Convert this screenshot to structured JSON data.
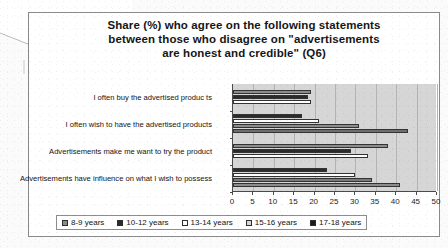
{
  "document": {
    "kind": "scanned-page",
    "fold_corner": true
  },
  "chart_data": {
    "type": "bar",
    "orientation": "horizontal",
    "title": "Share (%) who agree on the following statements between those who disagree on \"advertisements are honest and credible\" (Q6)",
    "title_lines": [
      "Share (%) who agree on the following statements",
      "between those who disagree on \"advertisements",
      "are honest and credible\" (Q6)"
    ],
    "xlabel": "",
    "ylabel": "",
    "xlim": [
      0,
      50
    ],
    "xticks": [
      0,
      5,
      10,
      15,
      20,
      25,
      30,
      35,
      40,
      45,
      50
    ],
    "grid": true,
    "legend_position": "bottom",
    "categories": [
      "I often buy  the advertised produc ts",
      "I often wish to have the advertised products",
      "Advertisements make me want to try the product",
      "Advertisements have influence on what I wish to possess"
    ],
    "series": [
      {
        "name": "8-9 years",
        "color": "#8c8c8c",
        "values": [
          0,
          0,
          0,
          0
        ]
      },
      {
        "name": "10-12 years",
        "color": "#2b2b2b",
        "values": [
          0,
          0,
          35,
          0
        ]
      },
      {
        "name": "13-14 years",
        "color": "#ffffff",
        "values": [
          0,
          0,
          0,
          0
        ]
      },
      {
        "name": "15-16 years",
        "color": "#d0d0d0",
        "values": [
          0,
          0,
          0,
          0
        ]
      },
      {
        "name": "17-18 years",
        "color": "#1a1a1a",
        "values": [
          0,
          0,
          0,
          0
        ]
      }
    ],
    "bars": [
      {
        "category_index": 0,
        "series": "8-9 years",
        "value": 19.0,
        "color": "#8c8c8c"
      },
      {
        "category_index": 0,
        "series": "10-12 years",
        "value": 18.5,
        "color": "#2b2b2b"
      },
      {
        "category_index": 0,
        "series": "13-14 years",
        "value": 19.0,
        "color": "#ffffff"
      },
      {
        "category_index": 1,
        "series": "10-12 years",
        "value": 17.0,
        "color": "#2b2b2b"
      },
      {
        "category_index": 1,
        "series": "13-14 years",
        "value": 21.0,
        "color": "#ffffff"
      },
      {
        "category_index": 1,
        "series": "15-16 years",
        "value": 31.0,
        "color": "#8c8c8c"
      },
      {
        "category_index": 1,
        "series": "17-18 years",
        "value": 43.0,
        "color": "#6e6e6e"
      },
      {
        "category_index": 2,
        "series": "8-9 years",
        "value": 38.0,
        "color": "#8c8c8c"
      },
      {
        "category_index": 2,
        "series": "10-12 years",
        "value": 29.0,
        "color": "#2b2b2b"
      },
      {
        "category_index": 2,
        "series": "13-14 years",
        "value": 33.0,
        "color": "#ffffff"
      },
      {
        "category_index": 3,
        "series": "10-12 years",
        "value": 23.0,
        "color": "#2b2b2b"
      },
      {
        "category_index": 3,
        "series": "13-14 years",
        "value": 30.0,
        "color": "#ffffff"
      },
      {
        "category_index": 3,
        "series": "15-16 years",
        "value": 34.0,
        "color": "#7a7a7a"
      },
      {
        "category_index": 3,
        "series": "17-18 years",
        "value": 41.0,
        "color": "#8c8c8c"
      }
    ],
    "legend": [
      {
        "label": "8-9 years",
        "color": "#8c8c8c"
      },
      {
        "label": "10-12 years",
        "color": "#2b2b2b"
      },
      {
        "label": "13-14 years",
        "color": "#ffffff"
      },
      {
        "label": "15-16 years",
        "color": "#d6d6d6"
      },
      {
        "label": "17-18 years",
        "color": "#1a1a1a"
      }
    ]
  }
}
